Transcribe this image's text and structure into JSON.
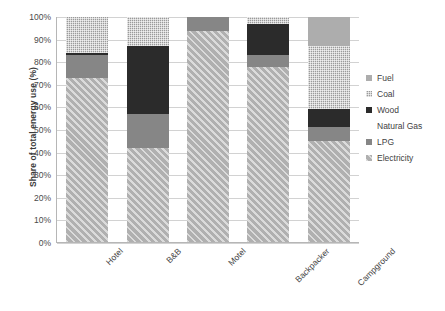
{
  "chart_data": {
    "type": "bar",
    "subtype": "100% stacked bar",
    "title": "",
    "xlabel": "",
    "ylabel": "Share of total energy use (%)",
    "ylim": [
      0,
      100
    ],
    "ytick_labels": [
      "0%",
      "10%",
      "20%",
      "30%",
      "40%",
      "50%",
      "60%",
      "70%",
      "80%",
      "90%",
      "100%"
    ],
    "ytick_values": [
      0,
      10,
      20,
      30,
      40,
      50,
      60,
      70,
      80,
      90,
      100
    ],
    "grid": true,
    "legend_position": "right",
    "categories": [
      "Hotel",
      "B&B",
      "Motel",
      "Backpacker",
      "Campground"
    ],
    "series": [
      {
        "name": "Electricity",
        "color": "#b0b0b0",
        "pattern": "diagonal-hatch",
        "values": [
          73,
          42,
          94,
          78,
          45
        ]
      },
      {
        "name": "LPG",
        "color": "#868686",
        "pattern": "solid",
        "values": [
          10,
          15,
          6,
          5,
          6
        ]
      },
      {
        "name": "Natural Gas",
        "color": "#6f6f6f",
        "pattern": "solid",
        "values": [
          0,
          0,
          0,
          0,
          0
        ]
      },
      {
        "name": "Wood",
        "color": "#2b2b2b",
        "pattern": "solid",
        "values": [
          1,
          30,
          0,
          14,
          8
        ]
      },
      {
        "name": "Coal",
        "color": "#9a9a9a",
        "pattern": "checker",
        "values": [
          16,
          13,
          0,
          3,
          28
        ]
      },
      {
        "name": "Fuel",
        "color": "#adadad",
        "pattern": "solid",
        "values": [
          0,
          0,
          0,
          0,
          13
        ]
      }
    ],
    "legend_entries": [
      "Fuel",
      "Coal",
      "Wood",
      "Natural Gas",
      "LPG",
      "Electricity"
    ]
  }
}
